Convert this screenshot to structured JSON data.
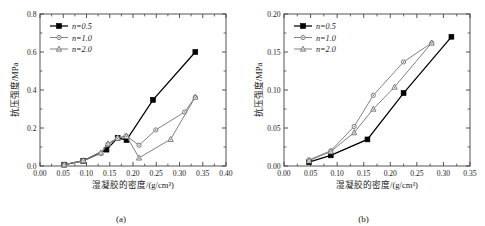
{
  "figure": {
    "background": "#ffffff",
    "panels": [
      "a",
      "b"
    ]
  },
  "panel_a": {
    "caption": "(a)",
    "caption_label": "(a)",
    "xlabel": "湿凝胶的密度/(g/cm³)",
    "ylabel": "抗压强度/MPa",
    "xticks": [
      "0.00",
      "0.05",
      "0.10",
      "0.15",
      "0.20",
      "0.25",
      "0.30",
      "0.35",
      "0.40"
    ],
    "yticks": [
      "0.0",
      "0.2",
      "0.4",
      "0.6",
      "0.8"
    ],
    "legend": [
      "n=0.5",
      "n=1.0",
      "n=2.0"
    ]
  },
  "panel_b": {
    "caption": "(b)",
    "caption_label": "(b)",
    "xlabel": "湿凝胶的密度/(g/cm³)",
    "ylabel": "抗压强度/MPa",
    "xticks": [
      "0.00",
      "0.05",
      "0.10",
      "0.15",
      "0.20",
      "0.25",
      "0.30",
      "0.35"
    ],
    "yticks": [
      "0.00",
      "0.05",
      "0.10",
      "0.15",
      "0.20"
    ],
    "legend": [
      "n=0.5",
      "n=1.0",
      "n=2.0"
    ]
  },
  "chart_data": [
    {
      "type": "line",
      "panel": "a",
      "title": "",
      "xlabel": "湿凝胶的密度/(g/cm³)",
      "ylabel": "抗压强度/MPa",
      "xlim": [
        0.0,
        0.4
      ],
      "ylim": [
        0.0,
        0.8
      ],
      "xticks": [
        0.0,
        0.05,
        0.1,
        0.15,
        0.2,
        0.25,
        0.3,
        0.35,
        0.4
      ],
      "yticks": [
        0.0,
        0.2,
        0.4,
        0.6,
        0.8
      ],
      "grid": false,
      "legend_position": "top-left",
      "series": [
        {
          "name": "n=0.5",
          "marker": "filled-square",
          "color": "#000000",
          "x": [
            0.052,
            0.093,
            0.143,
            0.167,
            0.186,
            0.243,
            0.334
          ],
          "y": [
            0.007,
            0.027,
            0.086,
            0.148,
            0.137,
            0.348,
            0.6
          ]
        },
        {
          "name": "n=1.0",
          "marker": "circle",
          "color": "#7a7a7a",
          "x": [
            0.052,
            0.093,
            0.131,
            0.146,
            0.167,
            0.185,
            0.213,
            0.249,
            0.311,
            0.334
          ],
          "y": [
            0.007,
            0.027,
            0.066,
            0.114,
            0.146,
            0.159,
            0.109,
            0.19,
            0.284,
            0.363
          ]
        },
        {
          "name": "n=2.0",
          "marker": "triangle",
          "color": "#7a7a7a",
          "x": [
            0.052,
            0.093,
            0.131,
            0.146,
            0.167,
            0.186,
            0.213,
            0.281,
            0.334
          ],
          "y": [
            0.007,
            0.029,
            0.07,
            0.118,
            0.148,
            0.157,
            0.043,
            0.141,
            0.363
          ]
        }
      ]
    },
    {
      "type": "line",
      "panel": "b",
      "title": "",
      "xlabel": "湿凝胶的密度/(g/cm³)",
      "ylabel": "抗压强度/MPa",
      "xlim": [
        0.0,
        0.35
      ],
      "ylim": [
        0.0,
        0.2
      ],
      "xticks": [
        0.0,
        0.05,
        0.1,
        0.15,
        0.2,
        0.25,
        0.3,
        0.35
      ],
      "yticks": [
        0.0,
        0.05,
        0.1,
        0.15,
        0.2
      ],
      "grid": false,
      "legend_position": "top-left",
      "series": [
        {
          "name": "n=0.5",
          "marker": "filled-square",
          "color": "#000000",
          "x": [
            0.047,
            0.088,
            0.157,
            0.225,
            0.315
          ],
          "y": [
            0.005,
            0.014,
            0.035,
            0.096,
            0.17
          ]
        },
        {
          "name": "n=1.0",
          "marker": "circle",
          "color": "#7a7a7a",
          "x": [
            0.047,
            0.088,
            0.132,
            0.168,
            0.225,
            0.278
          ],
          "y": [
            0.008,
            0.02,
            0.052,
            0.093,
            0.137,
            0.162
          ]
        },
        {
          "name": "n=2.0",
          "marker": "triangle",
          "color": "#7a7a7a",
          "x": [
            0.047,
            0.088,
            0.132,
            0.168,
            0.208,
            0.278
          ],
          "y": [
            0.007,
            0.019,
            0.044,
            0.075,
            0.104,
            0.162
          ]
        }
      ]
    }
  ]
}
